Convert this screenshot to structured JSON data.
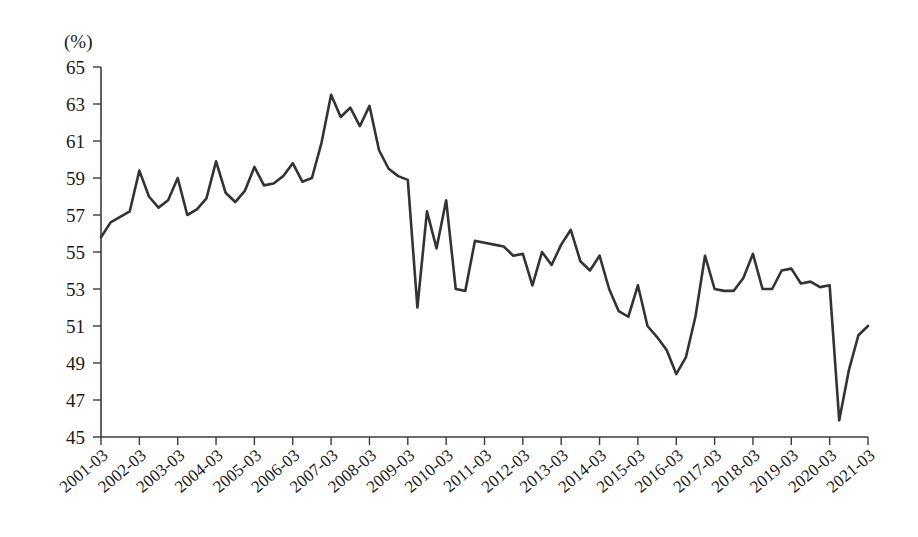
{
  "chart_data": {
    "type": "line",
    "title": "",
    "subtitle": "",
    "xlabel": "",
    "ylabel": "",
    "unit_label": "(%)",
    "ylim": [
      45,
      65
    ],
    "ytick_values": [
      45,
      47,
      49,
      51,
      53,
      55,
      57,
      59,
      61,
      63,
      65
    ],
    "ytick_labels": [
      "45",
      "47",
      "49",
      "51",
      "53",
      "55",
      "57",
      "59",
      "61",
      "63",
      "65"
    ],
    "grid": false,
    "legend": false,
    "legend_position": "none",
    "line_color": "#333333",
    "xtick_labels": [
      "2001-03",
      "2002-03",
      "2003-03",
      "2004-03",
      "2005-03",
      "2006-03",
      "2007-03",
      "2008-03",
      "2009-03",
      "2010-03",
      "2011-03",
      "2012-03",
      "2013-03",
      "2014-03",
      "2015-03",
      "2016-03",
      "2017-03",
      "2018-03",
      "2019-03",
      "2020-03",
      "2021-03"
    ],
    "x": [
      "2001-03",
      "2001-06",
      "2001-09",
      "2001-12",
      "2002-03",
      "2002-06",
      "2002-09",
      "2002-12",
      "2003-03",
      "2003-06",
      "2003-09",
      "2003-12",
      "2004-03",
      "2004-06",
      "2004-09",
      "2004-12",
      "2005-03",
      "2005-06",
      "2005-09",
      "2005-12",
      "2006-03",
      "2006-06",
      "2006-09",
      "2006-12",
      "2007-03",
      "2007-06",
      "2007-09",
      "2007-12",
      "2008-03",
      "2008-06",
      "2008-09",
      "2008-12",
      "2009-03",
      "2009-06",
      "2009-09",
      "2009-12",
      "2010-03",
      "2010-06",
      "2010-09",
      "2010-12",
      "2011-03",
      "2011-06",
      "2011-09",
      "2011-12",
      "2012-03",
      "2012-06",
      "2012-09",
      "2012-12",
      "2013-03",
      "2013-06",
      "2013-09",
      "2013-12",
      "2014-03",
      "2014-06",
      "2014-09",
      "2014-12",
      "2015-03",
      "2015-06",
      "2015-09",
      "2015-12",
      "2016-03",
      "2016-06",
      "2016-09",
      "2016-12",
      "2017-03",
      "2017-06",
      "2017-09",
      "2017-12",
      "2018-03",
      "2018-06",
      "2018-09",
      "2018-12",
      "2019-03",
      "2019-06",
      "2019-09",
      "2019-12",
      "2020-03",
      "2020-06",
      "2020-09",
      "2020-12",
      "2021-03"
    ],
    "values": [
      55.8,
      56.6,
      56.9,
      57.2,
      59.4,
      58.0,
      57.4,
      57.8,
      59.0,
      57.0,
      57.3,
      57.9,
      59.9,
      58.2,
      57.7,
      58.3,
      59.6,
      58.6,
      58.7,
      59.1,
      59.8,
      58.8,
      59.0,
      60.9,
      63.5,
      62.3,
      62.8,
      61.8,
      62.9,
      60.5,
      59.5,
      59.1,
      58.9,
      52.0,
      57.2,
      55.2,
      57.8,
      53.0,
      52.9,
      55.6,
      55.5,
      55.4,
      55.3,
      54.8,
      54.9,
      53.2,
      55.0,
      54.3,
      55.4,
      56.2,
      54.5,
      54.0,
      54.8,
      53.0,
      51.8,
      51.5,
      53.2,
      51.0,
      50.4,
      49.7,
      48.4,
      49.3,
      51.5,
      54.8,
      53.0,
      52.9,
      52.9,
      53.6,
      54.9,
      53.0,
      53.0,
      54.0,
      54.1,
      53.3,
      53.4,
      53.1,
      53.2,
      45.9,
      48.6,
      50.5,
      51.0
    ]
  }
}
